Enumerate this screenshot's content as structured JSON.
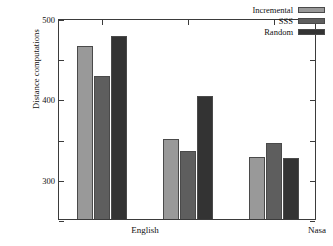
{
  "chart_data": {
    "type": "bar",
    "title": "",
    "subtitle": "",
    "xlabel": "",
    "ylabel": "Distance computations",
    "categories": [
      "English",
      "Nasa",
      "Color"
    ],
    "series": [
      {
        "name": "Incremental",
        "color": "#999999",
        "values": [
          430,
          200,
          155
        ]
      },
      {
        "name": "SSS",
        "color": "#5e5e5e",
        "values": [
          355,
          170,
          190
        ]
      },
      {
        "name": "Random",
        "color": "#333333",
        "values": [
          455,
          305,
          152
        ]
      }
    ],
    "ylim": [
      0,
      500
    ],
    "yticks": [
      0,
      100,
      200,
      300,
      400,
      500
    ],
    "ytick_labels": [
      "0",
      "100",
      "200",
      "300",
      "400",
      "500"
    ],
    "grid": false,
    "legend_position": "top-right",
    "frame": true,
    "annotations": []
  },
  "colors": {
    "axis": "#3b3b3b",
    "text": "#111111",
    "background": "#ffffff",
    "bar_edge": "#4a4a4a"
  }
}
